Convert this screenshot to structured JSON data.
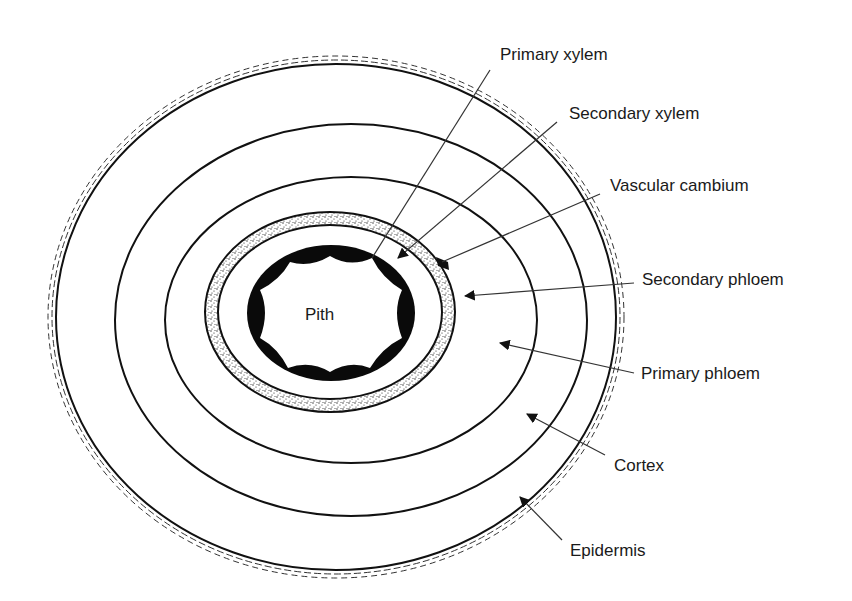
{
  "diagram": {
    "center_label": "Pith",
    "labels": [
      {
        "id": "primary-xylem",
        "text": "Primary xylem",
        "x": 500,
        "y": 46
      },
      {
        "id": "secondary-xylem",
        "text": "Secondary xylem",
        "x": 569,
        "y": 105
      },
      {
        "id": "vascular-cambium",
        "text": "Vascular cambium",
        "x": 610,
        "y": 177
      },
      {
        "id": "secondary-phloem",
        "text": "Secondary phloem",
        "x": 642,
        "y": 271
      },
      {
        "id": "primary-phloem",
        "text": "Primary phloem",
        "x": 641,
        "y": 365
      },
      {
        "id": "cortex",
        "text": "Cortex",
        "x": 614,
        "y": 457
      },
      {
        "id": "epidermis",
        "text": "Epidermis",
        "x": 570,
        "y": 542
      }
    ],
    "colors": {
      "stroke": "#111111",
      "leader": "#333333",
      "fill_xylem": "#0a0a0a",
      "background": "#ffffff"
    }
  }
}
